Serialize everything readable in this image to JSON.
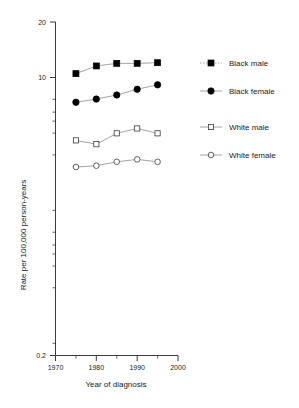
{
  "chart_data": {
    "type": "line",
    "title": "",
    "xlabel": "Year of diagnosis",
    "ylabel": "Rate per 100,000 person-years",
    "yscale": "log",
    "ylim": [
      0.2,
      20
    ],
    "xlim": [
      1970,
      2000
    ],
    "grid": false,
    "legend_position": "right",
    "x": [
      1975,
      1980,
      1985,
      1990,
      1995
    ],
    "xticks": [
      "1970",
      "1980",
      "1990",
      "2000"
    ],
    "xtick_values": [
      1970,
      1980,
      1990,
      2000
    ],
    "yticks": [
      "20",
      "10",
      "0.2"
    ],
    "ytick_values": [
      20,
      10,
      0.2
    ],
    "series": [
      {
        "name": "Black male",
        "marker": "filled-square",
        "values": [
          9.8,
          10.9,
          11.3,
          11.3,
          11.4
        ]
      },
      {
        "name": "Black female",
        "marker": "filled-circle",
        "values": [
          6.6,
          6.9,
          7.3,
          7.9,
          8.4
        ]
      },
      {
        "name": "White male",
        "marker": "open-square",
        "values": [
          3.9,
          3.7,
          4.3,
          4.6,
          4.3
        ]
      },
      {
        "name": "White female",
        "marker": "open-circle",
        "values": [
          2.7,
          2.75,
          2.9,
          3.0,
          2.9
        ]
      }
    ]
  },
  "axes": {
    "y_title": "Rate per 100,000 person-years",
    "x_title": "Year of diagnosis",
    "y_tick_top": "20",
    "y_tick_mid": "10",
    "y_tick_bottom": "0.2",
    "x_tick_1": "1970",
    "x_tick_2": "1980",
    "x_tick_3": "1990",
    "x_tick_4": "2000"
  },
  "legend": {
    "items": [
      {
        "label": "Black male",
        "marker": "filled-square"
      },
      {
        "label": "Black female",
        "marker": "filled-circle"
      },
      {
        "label": "White male",
        "marker": "open-square"
      },
      {
        "label": "White female",
        "marker": "open-circle"
      }
    ]
  }
}
